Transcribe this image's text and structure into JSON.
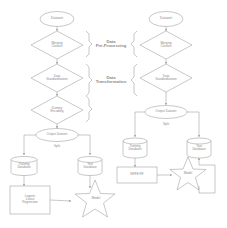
{
  "diagram": {
    "type": "flowchart",
    "stroke_color": "#9a9a9a",
    "text_color": "#8a8a8a",
    "background": "#ffffff",
    "stage_labels": {
      "pre_processing": "Data\nPre-Processing",
      "transformation": "Data\nTransformation"
    },
    "left_pipeline": {
      "dataset": "Dataset",
      "merging_classes": "Merging\nClasses",
      "data_standardization": "Data\nStandardization",
      "dummy_encoding": "Dummy\nEncoding",
      "output_dataset": "Output Dataset",
      "split": "Split",
      "training_database": "Training\nDatabase",
      "test_database": "Test\nDatabase",
      "algorithm": "Logistic\nLasso\nRegression",
      "model": "Model"
    },
    "right_pipeline": {
      "dataset": "Dataset",
      "merging_classes": "Merging\nClasses",
      "data_standardization": "Data\nStandardization",
      "output_dataset": "Output Dataset",
      "split": "Split",
      "training_database": "Training\nDatabase",
      "test_database": "Test\nDatabase",
      "algorithm": "NRFE RF",
      "model": "Model"
    }
  }
}
